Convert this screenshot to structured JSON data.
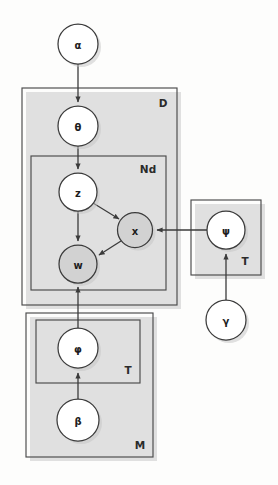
{
  "figure": {
    "type": "plate-notation-graphical-model",
    "background_color": "#fdfdfc",
    "stroke_color": "#3b3b3b",
    "shaded_node_color": "#d2d2d2",
    "unshaded_node_color": "#ffffff"
  },
  "nodes": [
    {
      "id": "alpha",
      "label": "α",
      "cx": 78,
      "cy": 44,
      "r": 20,
      "shaded": false
    },
    {
      "id": "theta",
      "label": "θ",
      "cx": 78,
      "cy": 126,
      "r": 20,
      "shaded": false
    },
    {
      "id": "z",
      "label": "z",
      "cx": 78,
      "cy": 192,
      "r": 19,
      "shaded": false
    },
    {
      "id": "x",
      "label": "x",
      "cx": 135,
      "cy": 230,
      "r": 17.5,
      "shaded": true
    },
    {
      "id": "w",
      "label": "w",
      "cx": 78,
      "cy": 264,
      "r": 19,
      "shaded": true
    },
    {
      "id": "psi",
      "label": "ψ",
      "cx": 226,
      "cy": 230,
      "r": 19,
      "shaded": false
    },
    {
      "id": "gamma",
      "label": "γ",
      "cx": 226,
      "cy": 320,
      "r": 20,
      "shaded": false
    },
    {
      "id": "phi",
      "label": "φ",
      "cx": 78,
      "cy": 348,
      "r": 20,
      "shaded": false
    },
    {
      "id": "beta",
      "label": "β",
      "cx": 78,
      "cy": 420,
      "r": 21,
      "shaded": false
    }
  ],
  "plates": [
    {
      "id": "plate-d",
      "label": "D",
      "x": 22,
      "y": 88,
      "w": 155,
      "h": 217,
      "label_x": 163,
      "label_y": 104
    },
    {
      "id": "plate-nd",
      "label": "Nd",
      "x": 31,
      "y": 156,
      "w": 135,
      "h": 134,
      "label_x": 148,
      "label_y": 170
    },
    {
      "id": "plate-psi-t",
      "label": "T",
      "x": 191,
      "y": 200,
      "w": 70,
      "h": 75,
      "label_x": 245,
      "label_y": 262
    },
    {
      "id": "plate-m",
      "label": "M",
      "x": 26,
      "y": 313,
      "w": 127,
      "h": 144,
      "label_x": 140,
      "label_y": 446
    },
    {
      "id": "plate-phi-t",
      "label": "T",
      "x": 36,
      "y": 320,
      "w": 104,
      "h": 63,
      "label_x": 128,
      "label_y": 371
    }
  ],
  "edges": [
    {
      "id": "alpha-to-theta",
      "from": "alpha",
      "to": "theta",
      "kind": "straight"
    },
    {
      "id": "theta-to-z",
      "from": "theta",
      "to": "z",
      "kind": "straight"
    },
    {
      "id": "z-to-x",
      "from": "z",
      "to": "x",
      "kind": "diagonal"
    },
    {
      "id": "z-to-w",
      "from": "z",
      "to": "w",
      "kind": "straight"
    },
    {
      "id": "x-to-w",
      "from": "x",
      "to": "w",
      "kind": "diagonal"
    },
    {
      "id": "psi-to-x",
      "from": "psi",
      "to": "x",
      "kind": "horizontal"
    },
    {
      "id": "gamma-to-psi",
      "from": "gamma",
      "to": "psi",
      "kind": "straight"
    },
    {
      "id": "phi-to-w",
      "from": "phi",
      "to": "w",
      "kind": "straight"
    },
    {
      "id": "beta-to-phi",
      "from": "beta",
      "to": "phi",
      "kind": "straight"
    }
  ],
  "labels": {
    "alpha": "α",
    "theta": "θ",
    "z": "z",
    "x": "x",
    "w": "w",
    "psi": "ψ",
    "gamma": "γ",
    "phi": "φ",
    "beta": "β",
    "plate_d": "D",
    "plate_nd": "Nd",
    "plate_t_psi": "T",
    "plate_t_phi": "T",
    "plate_m": "M"
  }
}
